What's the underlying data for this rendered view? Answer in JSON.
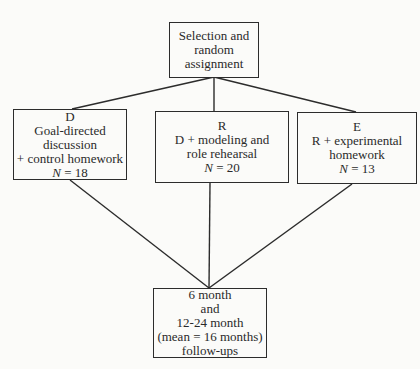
{
  "diagram": {
    "title_node": {
      "lines": [
        "Selection and",
        "random",
        "assignment"
      ]
    },
    "groups": [
      {
        "code": "D",
        "description": [
          "Goal-directed",
          "discussion",
          "+ control homework"
        ],
        "n_label": "N",
        "n_value": "= 18"
      },
      {
        "code": "R",
        "description": [
          "D + modeling and",
          "role rehearsal"
        ],
        "n_label": "N",
        "n_value": "= 20"
      },
      {
        "code": "E",
        "description": [
          "R + experimental",
          "homework"
        ],
        "n_label": "N",
        "n_value": "= 13"
      }
    ],
    "outcome_node": {
      "lines": [
        "6 month",
        "and",
        "12-24 month",
        "(mean = 16 months)",
        "follow-ups"
      ]
    },
    "edges": [
      {
        "from": "title_node",
        "to": "D"
      },
      {
        "from": "title_node",
        "to": "R"
      },
      {
        "from": "title_node",
        "to": "E"
      },
      {
        "from": "D",
        "to": "outcome_node"
      },
      {
        "from": "R",
        "to": "outcome_node"
      },
      {
        "from": "E",
        "to": "outcome_node"
      }
    ],
    "colors": {
      "line": "#2c2c2c",
      "text": "#2a2a2a",
      "background": "#fbfbf9"
    }
  }
}
